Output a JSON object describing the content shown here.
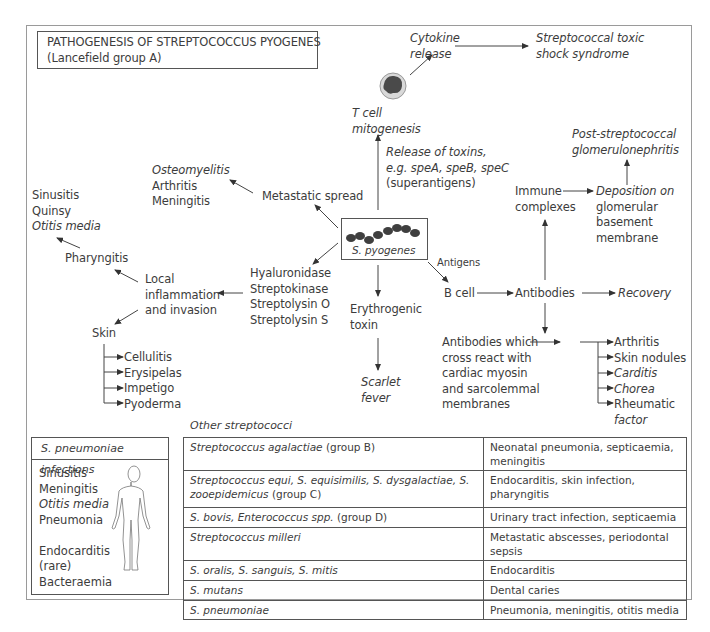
{
  "title": {
    "line1": "PATHOGENESIS OF STREPTOCOCCUS PYOGENES",
    "line2": "(Lancefield group A)"
  },
  "center": {
    "organism": "S. pyogenes"
  },
  "nodes": {
    "cytokine": [
      "Cytokine",
      "release"
    ],
    "tss": [
      "Streptococcal toxic",
      "shock syndrome"
    ],
    "tcell": [
      "T cell",
      "mitogenesis"
    ],
    "toxins": [
      "Release of toxins,",
      "e.g. speA, speB, speC",
      "(superantigens)"
    ],
    "psgn": [
      "Post-streptococcal",
      "glomerulonephritis"
    ],
    "immune": [
      "Immune",
      "complexes"
    ],
    "deposition": [
      "Deposition on",
      "glomerular",
      "basement",
      "membrane"
    ],
    "metastatic_targets": [
      "Osteomyelitis",
      "Arthritis",
      "Meningitis"
    ],
    "metastatic": "Metastatic spread",
    "upper_resp": [
      "Sinusitis",
      "Quinsy",
      "Otitis media"
    ],
    "pharyngitis": "Pharyngitis",
    "local": [
      "Local",
      "inflammation",
      "and invasion"
    ],
    "enzymes": [
      "Hyaluronidase",
      "Streptokinase",
      "Streptolysin O",
      "Streptolysin S"
    ],
    "antigens": "Antigens",
    "bcell": "B cell",
    "antibodies": "Antibodies",
    "recovery": "Recovery",
    "erythrogenic": [
      "Erythrogenic",
      "toxin"
    ],
    "scarlet": [
      "Scarlet",
      "fever"
    ],
    "skin": "Skin",
    "skin_items": [
      "Cellulitis",
      "Erysipelas",
      "Impetigo",
      "Pyoderma"
    ],
    "cross_react": [
      "Antibodies which",
      "cross react with",
      "cardiac myosin",
      "and sarcolemmal",
      "membranes"
    ],
    "rheumatic_items": [
      "Arthritis",
      "Skin nodules",
      "Carditis",
      "Chorea",
      "Rheumatic"
    ],
    "rheumatic_factor_cont": "factor"
  },
  "pneumoniae_box": {
    "header": "S. pneumoniae infections",
    "items": [
      "Sinusitis",
      "Meningitis",
      "Otitis media",
      "Pneumonia",
      "",
      "Endocarditis",
      "(rare)",
      "Bacteraemia"
    ]
  },
  "other_streptococci": {
    "label": "Other streptococci",
    "rows": [
      {
        "organism": "Streptococcus agalactiae",
        "group": " (group B)",
        "disease": "Neonatal pneumonia, septicaemia, meningitis"
      },
      {
        "organism": "Streptococcus equi, S. equisimilis, S. dysgalactiae, S. zooepidemicus",
        "group": " (group C)",
        "disease": "Endocarditis, skin infection, pharyngitis"
      },
      {
        "organism": "S. bovis, Enterococcus spp.",
        "group": " (group D)",
        "disease": "Urinary tract infection, septicaemia"
      },
      {
        "organism": "Streptococcus milleri",
        "group": "",
        "disease": "Metastatic abscesses, periodontal sepsis"
      },
      {
        "organism": "S. oralis, S. sanguis, S. mitis",
        "group": "",
        "disease": "Endocarditis"
      },
      {
        "organism": "S. mutans",
        "group": "",
        "disease": "Dental caries"
      },
      {
        "organism": "S. pneumoniae",
        "group": "",
        "disease": "Pneumonia, meningitis, otitis media"
      }
    ]
  }
}
